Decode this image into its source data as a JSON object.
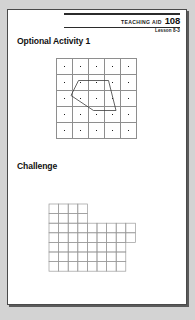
{
  "page": {
    "background_color": "#d3d3d3",
    "card_color": "#ffffff",
    "border_color": "#4a4a4a"
  },
  "header": {
    "teaching_aid_label": "TEACHING AID",
    "teaching_aid_number": "108",
    "lesson": "Lesson 8-3"
  },
  "sections": [
    {
      "id": "optional",
      "title": "Optional Activity 1"
    },
    {
      "id": "challenge",
      "title": "Challenge"
    }
  ],
  "dot_grid": {
    "rows": 5,
    "cols": 5,
    "cell_size": 15,
    "dot_color": "#1c1c1c",
    "line_color": "#8e8e8e",
    "polygon_color": "#3c3c3c",
    "polygon_vertices": [
      [
        1,
        1
      ],
      [
        3,
        1
      ],
      [
        3.5,
        3
      ],
      [
        2,
        3
      ],
      [
        0.5,
        2
      ],
      [
        1,
        1
      ]
    ]
  },
  "challenge_shape": {
    "cell_size": 9.6,
    "line_color": "#9a9a9a",
    "outline_color": "#8a8a8a",
    "rows": [
      {
        "start": 0,
        "count": 4
      },
      {
        "start": 0,
        "count": 4
      },
      {
        "start": 0,
        "count": 9
      },
      {
        "start": 0,
        "count": 9
      },
      {
        "start": 0,
        "count": 8
      },
      {
        "start": 0,
        "count": 8
      },
      {
        "start": 0,
        "count": 8
      }
    ]
  }
}
